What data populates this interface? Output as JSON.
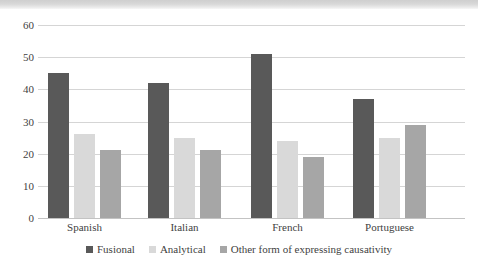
{
  "chart_data": {
    "type": "bar",
    "title": "",
    "subtitle": "",
    "xlabel": "",
    "ylabel": "",
    "categories": [
      "Spanish",
      "Italian",
      "French",
      "Portuguese"
    ],
    "series": [
      {
        "name": "Fusional",
        "color": "#595959",
        "values": [
          45,
          42,
          51,
          37
        ]
      },
      {
        "name": "Analytical",
        "color": "#d9d9d9",
        "values": [
          26,
          25,
          24,
          25
        ]
      },
      {
        "name": "Other form of expressing causativity",
        "color": "#a6a6a6",
        "values": [
          21,
          21,
          19,
          29
        ]
      }
    ],
    "ylim": [
      0,
      60
    ],
    "ytick_step": 10,
    "yticks": [
      0,
      10,
      20,
      30,
      40,
      50,
      60
    ],
    "ytick_labels": [
      "0",
      "10",
      "20",
      "30",
      "40",
      "50",
      "60"
    ],
    "grid": true,
    "grid_axis": "y",
    "legend_position": "bottom",
    "annotations": []
  },
  "axis": {
    "y_tick_labels": [
      "60",
      "50",
      "40",
      "30",
      "20",
      "10",
      "0"
    ]
  },
  "legend": {
    "items": [
      {
        "label": "Fusional",
        "color": "#595959"
      },
      {
        "label": "Analytical",
        "color": "#d9d9d9"
      },
      {
        "label": "Other form of expressing causativity",
        "color": "#a6a6a6"
      }
    ]
  }
}
